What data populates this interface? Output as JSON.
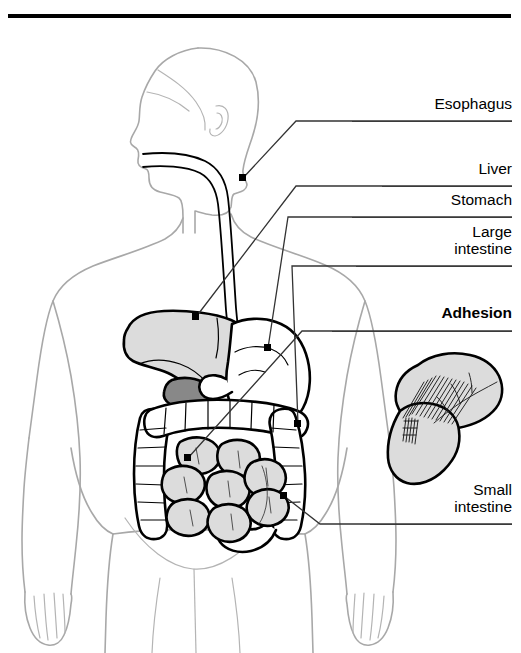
{
  "document": {
    "title": "Illustration of an Adhesion",
    "title_clipped": true
  },
  "colors": {
    "body_outline": "#a8a8a8",
    "organ_outline": "#000000",
    "organ_fill_light": "#dcdcdc",
    "organ_fill_white": "#ffffff",
    "gallbladder_fill": "#888888",
    "leader_line": "#333333",
    "rule": "#3a3a3a",
    "title_rule": "#000000",
    "background": "#ffffff"
  },
  "labels": [
    {
      "id": "esophagus",
      "text": "Esophagus",
      "bold": false,
      "lines": 1,
      "x": 352,
      "y": 96,
      "width": 160,
      "rule_y": 121,
      "rule_x": 352,
      "rule_width": 160,
      "leader": "M 241,133 L 296,133 L 243,195 L 243,216"
    },
    {
      "id": "liver",
      "text": "Liver",
      "bold": false,
      "lines": 1,
      "x": 352,
      "y": 161,
      "width": 160,
      "rule_y": 186,
      "rule_x": 382,
      "rule_width": 130,
      "leader": "M 382,186 L 296,186 L 193,303"
    },
    {
      "id": "stomach",
      "text": "Stomach",
      "bold": false,
      "lines": 1,
      "x": 352,
      "y": 192,
      "width": 160,
      "rule_y": 217,
      "rule_x": 352,
      "rule_width": 160,
      "leader": "M 352,217 L 288,217 L 228,297"
    },
    {
      "id": "large-intestine",
      "text": "Large\nintestine",
      "bold": false,
      "lines": 2,
      "x": 352,
      "y": 223,
      "width": 160,
      "rule_y": 266,
      "rule_x": 356,
      "rule_width": 156,
      "leader": "M 356,266 L 292,266 L 210,352"
    },
    {
      "id": "adhesion",
      "text": "Adhesion",
      "bold": true,
      "lines": 1,
      "x": 352,
      "y": 305,
      "width": 160,
      "rule_y": 331,
      "rule_x": 332,
      "rule_width": 180,
      "leader": "M 332,331 L 302,331 L 238,400"
    },
    {
      "id": "small-intestine",
      "text": "Small\nintestine",
      "bold": false,
      "lines": 2,
      "x": 352,
      "y": 481,
      "width": 160,
      "rule_y": 524,
      "rule_x": 370,
      "rule_width": 142,
      "leader": "M 370,524 L 320,524 L 283,496"
    }
  ],
  "anatomy": {
    "figure_description": "Front-facing human body outline with head turned in left profile, arms at the sides, and the digestive tract drawn inside the abdomen.",
    "organs": [
      {
        "id": "esophagus",
        "name": "Esophagus",
        "fill": "#ffffff",
        "stroke": "#000000"
      },
      {
        "id": "liver",
        "name": "Liver",
        "fill": "#dcdcdc",
        "stroke": "#000000"
      },
      {
        "id": "gallbladder",
        "name": "Gallbladder",
        "fill": "#888888",
        "stroke": "#000000"
      },
      {
        "id": "stomach",
        "name": "Stomach",
        "fill": "#ffffff",
        "stroke": "#000000"
      },
      {
        "id": "large-intestine",
        "name": "Large intestine",
        "fill": "#ffffff",
        "stroke": "#000000"
      },
      {
        "id": "small-intestine",
        "name": "Small intestine",
        "fill": "#dcdcdc",
        "stroke": "#000000"
      },
      {
        "id": "adhesion-inset",
        "name": "Adhesion detail",
        "fill": "#dcdcdc",
        "stroke": "#000000"
      }
    ],
    "adhesion_inset": {
      "description": "Enlarged view of two adjacent bowel loops joined by fibrous adhesion bands drawn as fine cross-hatched strands.",
      "band_count": 14
    }
  }
}
